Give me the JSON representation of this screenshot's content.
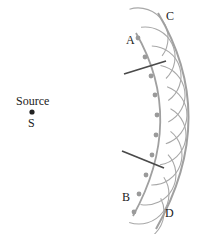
{
  "diagram": {
    "source": {
      "label_top": "Source",
      "label_bottom": "S",
      "x": 32,
      "y": 112
    },
    "wavefront_initial": {
      "start_label": "A",
      "end_label": "B"
    },
    "wavefront_new": {
      "start_label": "C",
      "end_label": "D"
    },
    "wavelet_sources": [
      [
        138,
        38
      ],
      [
        145,
        57
      ],
      [
        151,
        76
      ],
      [
        155,
        95
      ],
      [
        157,
        115
      ],
      [
        156,
        135
      ],
      [
        152,
        155
      ],
      [
        146,
        175
      ],
      [
        139,
        194
      ],
      [
        134,
        212
      ]
    ],
    "wavelet_radius": 30,
    "rays": [
      {
        "x1": 124,
        "y1": 74,
        "x2": 166,
        "y2": 61
      },
      {
        "x1": 122,
        "y1": 151,
        "x2": 164,
        "y2": 168
      }
    ],
    "colors": {
      "wavefront": "#a0a0a0",
      "wavelet": "#a8a8a8",
      "dot": "#9a9a9a",
      "ray": "#4a4a4a",
      "text": "#222222"
    }
  }
}
